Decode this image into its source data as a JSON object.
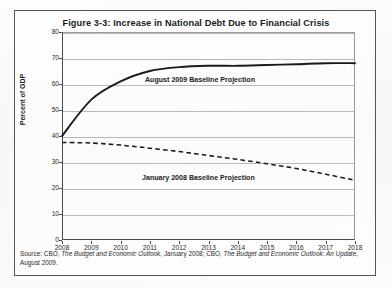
{
  "figure": {
    "title": "Figure 3-3: Increase in National Debt Due to Financial Crisis",
    "source_line_1_prefix": "Source: CBO, ",
    "source_italic_1": "The Budget and Economic Outlook",
    "source_mid": ", January 2008; CBO, ",
    "source_italic_2": "The Budget and Economic Outlook: An Update",
    "source_suffix": ",",
    "source_line_2": "August 2009."
  },
  "annotations": {
    "solid_label": "August 2009 Baseline Projection",
    "dashed_label": "January 2008 Baseline Projection"
  },
  "chart_data": {
    "type": "line",
    "title": "Figure 3-3: Increase in National Debt Due to Financial Crisis",
    "xlabel": "",
    "ylabel": "Percent of GDP",
    "xlim": [
      2008,
      2018
    ],
    "ylim": [
      0,
      80
    ],
    "xticks": [
      "2008",
      "2009",
      "2010",
      "2011",
      "2012",
      "2013",
      "2014",
      "2015",
      "2016",
      "2017",
      "2018"
    ],
    "yticks": [
      "0",
      "10",
      "20",
      "30",
      "40",
      "50",
      "60",
      "70",
      "80"
    ],
    "grid": "horizontal",
    "legend": "inline-annotations",
    "x": [
      2008,
      2009,
      2010,
      2011,
      2012,
      2013,
      2014,
      2015,
      2016,
      2017,
      2018
    ],
    "series": [
      {
        "name": "August 2009 Baseline Projection",
        "style": "solid",
        "color": "#1a1a1a",
        "values": [
          40,
          54,
          61,
          65,
          66.5,
          67,
          67,
          67.3,
          67.6,
          68,
          68
        ]
      },
      {
        "name": "January 2008 Baseline Projection",
        "style": "dashed",
        "color": "#1a1a1a",
        "values": [
          37.5,
          37.3,
          36.5,
          35.3,
          34,
          32.5,
          31,
          29.3,
          27.5,
          25.3,
          23
        ]
      }
    ]
  }
}
